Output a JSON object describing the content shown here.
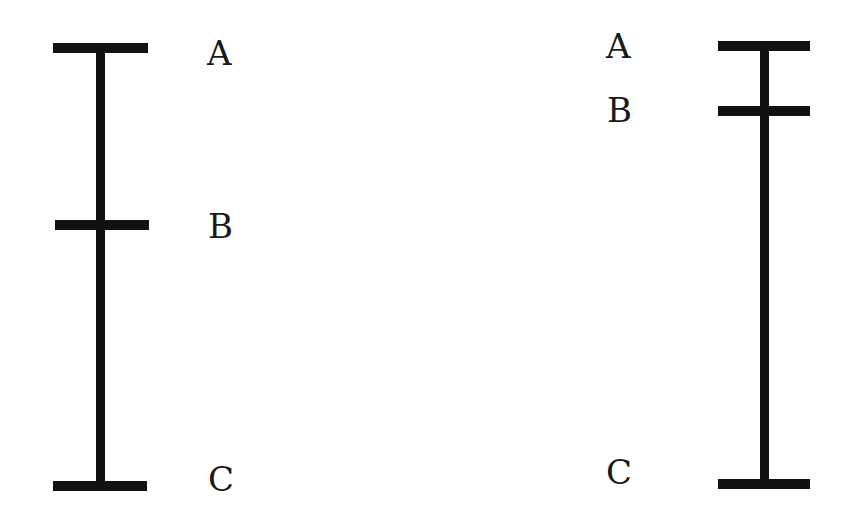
{
  "colors": {
    "line": "#111111",
    "text": "#1a1a1a",
    "background": "#ffffff"
  },
  "figures": [
    {
      "name": "left-segment",
      "labels": [
        {
          "text": "A",
          "x": 207,
          "y": 36
        },
        {
          "text": "B",
          "x": 208,
          "y": 209
        },
        {
          "text": "C",
          "x": 208,
          "y": 462
        }
      ],
      "vertical": {
        "x": 96,
        "y": 44,
        "w": 9,
        "h": 446
      },
      "ticks": [
        {
          "point": "A",
          "x": 53,
          "y": 43,
          "w": 95,
          "h": 10
        },
        {
          "point": "B",
          "x": 55,
          "y": 220,
          "w": 94,
          "h": 10
        },
        {
          "point": "C",
          "x": 53,
          "y": 481,
          "w": 94,
          "h": 10
        }
      ]
    },
    {
      "name": "right-segment",
      "labels": [
        {
          "text": "A",
          "x": 606,
          "y": 29
        },
        {
          "text": "B",
          "x": 607,
          "y": 93
        },
        {
          "text": "C",
          "x": 606,
          "y": 455
        }
      ],
      "vertical": {
        "x": 760,
        "y": 41,
        "w": 9,
        "h": 447
      },
      "ticks": [
        {
          "point": "A",
          "x": 718,
          "y": 41,
          "w": 92,
          "h": 10
        },
        {
          "point": "B",
          "x": 718,
          "y": 106,
          "w": 92,
          "h": 10
        },
        {
          "point": "C",
          "x": 718,
          "y": 479,
          "w": 92,
          "h": 10
        }
      ]
    }
  ]
}
